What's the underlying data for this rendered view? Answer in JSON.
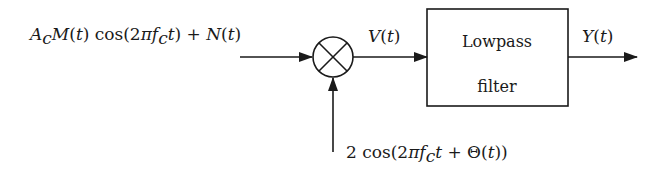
{
  "diagram": {
    "type": "block-diagram",
    "input_signal": {
      "label": "A_c M(t) cos(2πf_c t) + N(t)",
      "display": "AcM(t) cos(2πfct) + N(t)"
    },
    "mixer": {
      "symbol": "×",
      "name": "multiplier"
    },
    "mixer_output": {
      "label": "V(t)"
    },
    "local_oscillator": {
      "label": "2 cos(2πf_c t + Θ(t))"
    },
    "filter": {
      "line1": "Lowpass",
      "line2": "filter"
    },
    "output_signal": {
      "label": "Y(t)"
    }
  }
}
